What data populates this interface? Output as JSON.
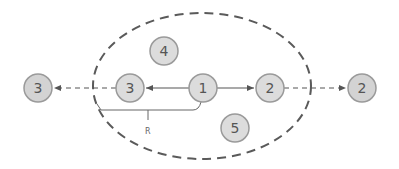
{
  "diagram": {
    "colors": {
      "node_fill": "#dcdcdc",
      "node_fill_outer": "#d3d3d3",
      "node_stroke": "#9a9a9a",
      "edge": "#555555",
      "ellipse": "#5a5a5a",
      "text": "#555555"
    },
    "region": {
      "cx": 202,
      "cy": 86,
      "rx": 109,
      "ry": 73,
      "style": "dashed"
    },
    "nodes": [
      {
        "id": "n3-outer",
        "label": "3",
        "x": 38,
        "y": 88,
        "outside": true
      },
      {
        "id": "n3-inner",
        "label": "3",
        "x": 130,
        "y": 88,
        "outside": false
      },
      {
        "id": "n1",
        "label": "1",
        "x": 203,
        "y": 88,
        "outside": false
      },
      {
        "id": "n2-inner",
        "label": "2",
        "x": 270,
        "y": 88,
        "outside": false
      },
      {
        "id": "n2-outer",
        "label": "2",
        "x": 362,
        "y": 88,
        "outside": true
      },
      {
        "id": "n4",
        "label": "4",
        "x": 164,
        "y": 51,
        "outside": false
      },
      {
        "id": "n5",
        "label": "5",
        "x": 235,
        "y": 128,
        "outside": false
      }
    ],
    "edges": [
      {
        "from": "n1",
        "to": "n3-inner",
        "style": "solid"
      },
      {
        "from": "n1",
        "to": "n2-inner",
        "style": "solid"
      },
      {
        "from": "n3-inner",
        "to": "n3-outer",
        "style": "dashed"
      },
      {
        "from": "n2-inner",
        "to": "n2-outer",
        "style": "dashed"
      }
    ],
    "radius_bracket": {
      "label": "R"
    }
  }
}
